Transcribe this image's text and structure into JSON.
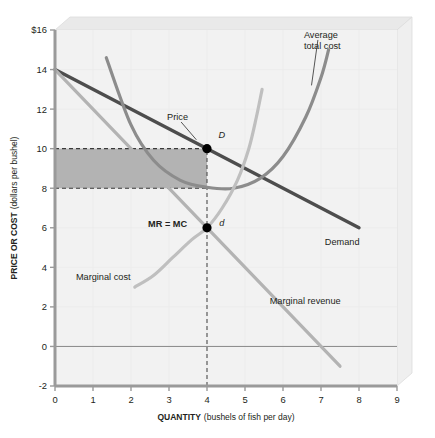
{
  "chart_data": {
    "type": "line",
    "title": "",
    "xlabel": "QUANTITY",
    "xlabel_units": "(bushels of fish per day)",
    "ylabel": "PRICE OR COST",
    "ylabel_units": "(dollars per bushel)",
    "xlim": [
      0,
      9
    ],
    "ylim": [
      -2,
      16
    ],
    "grid": false,
    "x_ticks": [
      "0",
      "1",
      "2",
      "3",
      "4",
      "5",
      "6",
      "7",
      "8",
      "9"
    ],
    "x_tick_values": [
      0,
      1,
      2,
      3,
      4,
      5,
      6,
      7,
      8,
      9
    ],
    "y_ticks": [
      "$16",
      "14",
      "12",
      "10",
      "8",
      "6",
      "4",
      "2",
      "0",
      "-2"
    ],
    "y_tick_values": [
      16,
      14,
      12,
      10,
      8,
      6,
      4,
      2,
      0,
      -2
    ],
    "zero_line": 0,
    "series": [
      {
        "name": "Demand",
        "label": "Demand",
        "color": "#4d4d4d",
        "kind": "line",
        "points": [
          [
            0,
            14
          ],
          [
            8,
            6
          ]
        ]
      },
      {
        "name": "Marginal revenue",
        "label": "Marginal revenue",
        "color": "#b3b3b3",
        "kind": "line",
        "points": [
          [
            0,
            14
          ],
          [
            7.5,
            -1
          ]
        ]
      },
      {
        "name": "Average total cost",
        "label": "Average total cost",
        "color": "#8c8c8c",
        "kind": "u-curve",
        "points": [
          [
            1.35,
            14.6
          ],
          [
            2.0,
            11.2
          ],
          [
            2.6,
            9.4
          ],
          [
            3.3,
            8.4
          ],
          [
            4.0,
            8.05
          ],
          [
            4.7,
            8.0
          ],
          [
            5.4,
            8.5
          ],
          [
            6.0,
            9.6
          ],
          [
            6.6,
            11.6
          ],
          [
            7.0,
            13.6
          ],
          [
            7.2,
            15.0
          ]
        ]
      },
      {
        "name": "Marginal cost",
        "label": "Marginal cost",
        "color": "#bfbfbf",
        "kind": "rising-curve",
        "points": [
          [
            2.1,
            3.0
          ],
          [
            2.6,
            3.6
          ],
          [
            3.1,
            4.5
          ],
          [
            3.6,
            5.4
          ],
          [
            4.0,
            6.0
          ],
          [
            4.4,
            7.0
          ],
          [
            4.8,
            8.4
          ],
          [
            5.1,
            10.0
          ],
          [
            5.3,
            11.6
          ],
          [
            5.45,
            13.0
          ]
        ]
      }
    ],
    "annotations": [
      {
        "name": "price",
        "text": "Price",
        "x": 2.95,
        "y": 11.45,
        "leader_to": [
          3.72,
          10.45
        ]
      },
      {
        "name": "point-D",
        "text": "D",
        "x": 4.3,
        "y": 10.55,
        "italic": true
      },
      {
        "name": "point-d",
        "text": "d",
        "x": 4.32,
        "y": 6.1,
        "italic": true
      },
      {
        "name": "mr-equals-mc",
        "text": "MR = MC",
        "x": 2.45,
        "y": 6.05,
        "bold": true
      },
      {
        "name": "average-total-cost",
        "text": "Average total cost",
        "x": 6.55,
        "y": 15.6,
        "leader_to": [
          6.75,
          13.2
        ]
      },
      {
        "name": "marginal-cost",
        "text": "Marginal cost",
        "x": 0.55,
        "y": 3.35
      },
      {
        "name": "demand",
        "text": "Demand",
        "x": 7.1,
        "y": 5.15
      },
      {
        "name": "marginal-revenue",
        "text": "Marginal revenue",
        "x": 5.65,
        "y": 2.15
      }
    ],
    "markers": [
      {
        "name": "point-D",
        "x": 4,
        "y": 10,
        "color": "#000000"
      },
      {
        "name": "point-d",
        "x": 4,
        "y": 6,
        "color": "#000000"
      }
    ],
    "profit_rectangle": {
      "name": "profit-area",
      "x0": 0,
      "x1": 4,
      "y0": 8,
      "y1": 10,
      "fill": "#a8a8a8",
      "border": "dashed"
    },
    "quantity_guide": {
      "x": 4,
      "y_from": -2,
      "y_to": 10,
      "style": "dashed"
    },
    "colors": {
      "plot_background": "#f2f2f2",
      "box_top": "#e6e6e6",
      "box_side": "#ededed",
      "axis": "#9a9a9a",
      "text": "#231f20"
    }
  }
}
